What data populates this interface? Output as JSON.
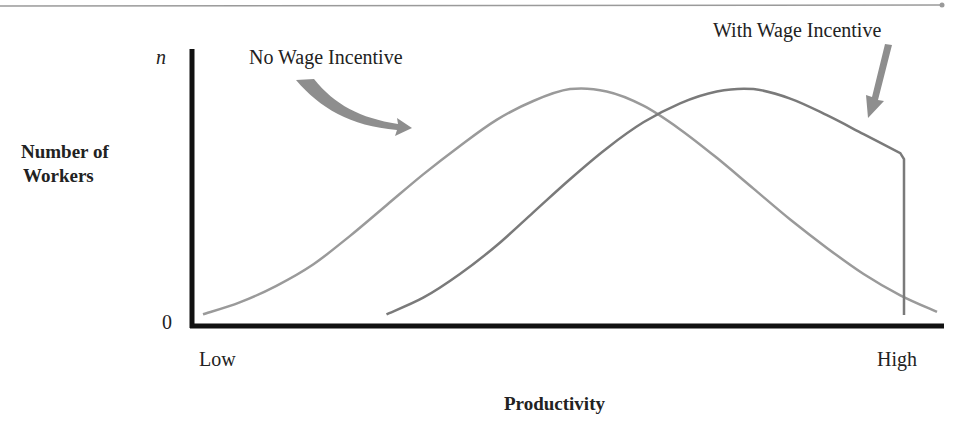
{
  "chart_data": {
    "type": "line",
    "title": "",
    "xlabel": "Productivity",
    "ylabel": "Number of Workers",
    "x_tick_labels": [
      "Low",
      "High"
    ],
    "y_tick_labels": [
      "0",
      "n"
    ],
    "x": [
      0,
      5,
      10,
      15,
      20,
      25,
      30,
      35,
      40,
      45,
      50,
      55,
      60,
      65,
      70,
      75,
      80,
      85,
      90,
      95,
      100
    ],
    "series": [
      {
        "name": "No Wage Incentive",
        "color": "#9a9a9a",
        "values": [
          2,
          7,
          14,
          23,
          35,
          48,
          61,
          73,
          84,
          92,
          97,
          96,
          90,
          80,
          68,
          55,
          42,
          30,
          19,
          10,
          3
        ]
      },
      {
        "name": "With Wage Incentive",
        "color": "#7a7a7a",
        "x_start": 25,
        "x_end": 95.5,
        "values": [
          null,
          null,
          null,
          null,
          null,
          2,
          9,
          19,
          31,
          45,
          59,
          72,
          83,
          91,
          96,
          97,
          93,
          86,
          78,
          70,
          0
        ],
        "note": "curve truncated with vertical drop to zero at high productivity"
      }
    ],
    "ylim": [
      0,
      100
    ],
    "xlim": [
      0,
      100
    ],
    "grid": false,
    "legend_position": "annotations with arrows above curves"
  },
  "labels": {
    "y_axis_title_line1": "Number of",
    "y_axis_title_line2": "Workers",
    "y_top": "n",
    "y_zero": "0",
    "x_low": "Low",
    "x_high": "High",
    "x_axis_title": "Productivity",
    "annotation_no_wage": "No Wage Incentive",
    "annotation_with_wage": "With Wage Incentive"
  }
}
